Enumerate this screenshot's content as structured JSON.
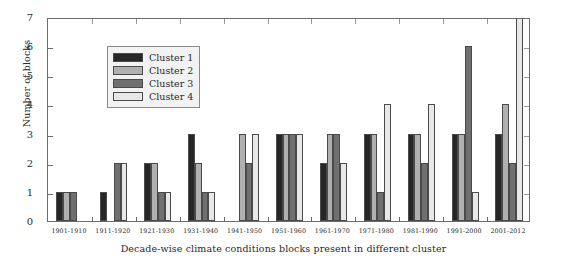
{
  "chart_data": {
    "type": "bar",
    "title": "",
    "xlabel": "Decade-wise climate conditions blocks present in different cluster",
    "ylabel": "Number of blocks",
    "ylim": [
      0,
      7
    ],
    "yticks": [
      0,
      1,
      2,
      3,
      4,
      5,
      6,
      7
    ],
    "ytick_labels": [
      "0",
      "1",
      "2",
      "3",
      "4",
      "5",
      "6",
      "7"
    ],
    "grid": false,
    "legend_position": "upper-left-inside",
    "categories": [
      "1901-1910",
      "1911-1920",
      "1921-1930",
      "1931-1940",
      "1941-1950",
      "1951-1960",
      "1961-1970",
      "1971-1980",
      "1981-1990",
      "1991-2000",
      "2001-2012"
    ],
    "series": [
      {
        "name": "Cluster 1",
        "color": "#262626",
        "values": [
          1,
          1,
          2,
          3,
          0,
          3,
          2,
          3,
          3,
          3,
          3
        ]
      },
      {
        "name": "Cluster 2",
        "color": "#b0b0b0",
        "values": [
          1,
          0,
          2,
          2,
          3,
          3,
          3,
          3,
          3,
          3,
          4
        ]
      },
      {
        "name": "Cluster 3",
        "color": "#707070",
        "values": [
          1,
          2,
          1,
          1,
          2,
          3,
          3,
          1,
          2,
          6,
          2
        ]
      },
      {
        "name": "Cluster 4",
        "color": "#e8e8e8",
        "values": [
          0,
          2,
          1,
          1,
          3,
          3,
          2,
          4,
          4,
          1,
          7.6
        ]
      }
    ]
  },
  "legend": {
    "items": [
      {
        "label": "Cluster 1",
        "color": "#262626"
      },
      {
        "label": "Cluster 2",
        "color": "#b0b0b0"
      },
      {
        "label": "Cluster 3",
        "color": "#707070"
      },
      {
        "label": "Cluster 4",
        "color": "#e8e8e8"
      }
    ]
  },
  "axes": {
    "y_label": "Number of blocks",
    "x_label": "Decade-wise climate conditions blocks present in different cluster"
  },
  "colors": {
    "frame": "#6b6b6b",
    "bar_outline": "#4a4a4a",
    "text": "#2a2a2a",
    "legend_bg": "#f2f2f2",
    "background": "#ffffff"
  }
}
